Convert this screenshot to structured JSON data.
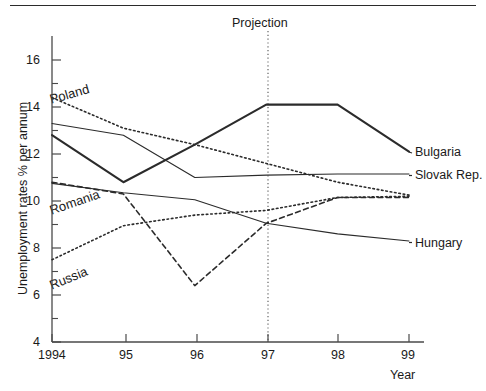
{
  "chart_data": {
    "type": "line",
    "title": "",
    "xlabel": "Year",
    "ylabel": "Unemployment rates % per annum",
    "x": [
      1994,
      1995,
      1996,
      1997,
      1998,
      1999
    ],
    "xtick_labels": [
      "1994",
      "95",
      "96",
      "97",
      "98",
      "99"
    ],
    "ytick_labels": [
      "16",
      "14",
      "12",
      "10",
      "8",
      "6",
      "4"
    ],
    "ytick_values": [
      16,
      14,
      12,
      10,
      8,
      6,
      4
    ],
    "yminor_values": [
      15,
      13,
      11,
      9,
      7,
      5
    ],
    "ylim": [
      4,
      16.8
    ],
    "xlim": [
      1993.78,
      1999.22
    ],
    "grid": false,
    "legend_position": "right-of-axes-and-inline",
    "annotations": [
      {
        "text": "Projection",
        "x": 1997,
        "y": 16.6,
        "type": "vline-label"
      }
    ],
    "vline": {
      "x": 1997,
      "style": "dotted",
      "label": "Projection"
    },
    "series": [
      {
        "name": "Bulgaria",
        "style": "solid-thick",
        "label_position": "right",
        "values": [
          12.8,
          10.8,
          12.4,
          14.1,
          14.1,
          12.1
        ]
      },
      {
        "name": "Slovak Rep.",
        "style": "solid-thin",
        "label_position": "right",
        "values": [
          13.3,
          12.8,
          11.0,
          11.1,
          11.15,
          11.15
        ]
      },
      {
        "name": "Poland",
        "style": "dotted",
        "label_position": "inline",
        "values": [
          14.4,
          13.1,
          12.4,
          11.6,
          10.8,
          10.25
        ]
      },
      {
        "name": "Romania",
        "style": "dashed",
        "label_position": "inline",
        "values": [
          10.8,
          10.3,
          6.4,
          9.05,
          10.15,
          10.15
        ]
      },
      {
        "name": "Russia",
        "style": "dotted",
        "label_position": "inline",
        "values": [
          7.5,
          8.95,
          9.4,
          9.6,
          10.15,
          10.2
        ]
      },
      {
        "name": "Hungary",
        "style": "solid-thin",
        "label_position": "right",
        "values": [
          10.75,
          10.35,
          10.05,
          9.05,
          8.6,
          8.3
        ]
      }
    ]
  },
  "axis": {
    "ylabel": "Unemployment rates % per annum",
    "xlabel": "Year",
    "yticks": [
      "16",
      "14",
      "12",
      "10",
      "8",
      "6",
      "4"
    ],
    "xticks": [
      "1994",
      "95",
      "96",
      "97",
      "98",
      "99"
    ]
  },
  "labels": {
    "projection": "Projection",
    "bulgaria": "Bulgaria",
    "slovak_rep": "Slovak Rep.",
    "hungary": "Hungary",
    "poland": "Poland",
    "romania": "Romania",
    "russia": "Russia"
  },
  "colors": {
    "ink": "#1a1a1a",
    "line": "#2b2b2b",
    "background": "#ffffff"
  }
}
